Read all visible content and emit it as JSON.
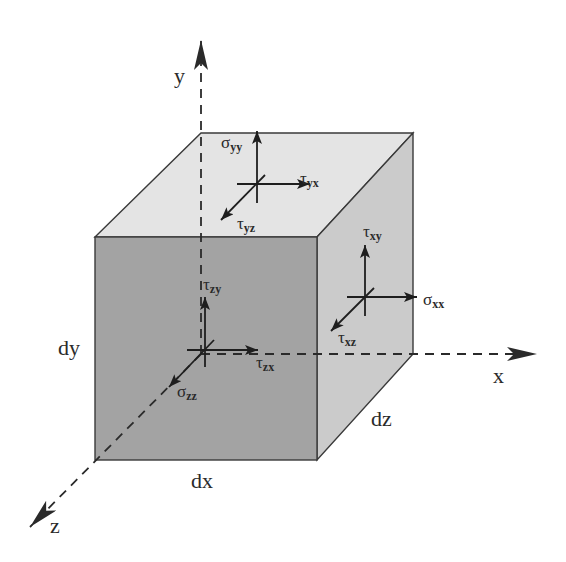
{
  "diagram": {
    "colors": {
      "front_face": "#a3a3a3",
      "top_face": "#e4e4e4",
      "right_face": "#cbcbcb",
      "edge": "#3a3a3a",
      "arrow": "#222222",
      "label": "#2a2a2a"
    },
    "axes": {
      "x": {
        "label": "x"
      },
      "y": {
        "label": "y"
      },
      "z": {
        "label": "z"
      }
    },
    "dimensions": {
      "dx": "dx",
      "dy": "dy",
      "dz": "dz"
    },
    "faces": {
      "top": {
        "name": "y-face",
        "stresses": [
          {
            "id": "sigma_yy",
            "symbol": "σ",
            "sub": "yy",
            "direction": "y"
          },
          {
            "id": "tau_yx",
            "symbol": "τ",
            "sub": "yx",
            "direction": "x"
          },
          {
            "id": "tau_yz",
            "symbol": "τ",
            "sub": "yz",
            "direction": "z"
          }
        ]
      },
      "right": {
        "name": "x-face",
        "stresses": [
          {
            "id": "tau_xy",
            "symbol": "τ",
            "sub": "xy",
            "direction": "y"
          },
          {
            "id": "sigma_xx",
            "symbol": "σ",
            "sub": "xx",
            "direction": "x"
          },
          {
            "id": "tau_xz",
            "symbol": "τ",
            "sub": "xz",
            "direction": "z"
          }
        ]
      },
      "front": {
        "name": "z-face",
        "stresses": [
          {
            "id": "tau_zy",
            "symbol": "τ",
            "sub": "zy",
            "direction": "y"
          },
          {
            "id": "tau_zx",
            "symbol": "τ",
            "sub": "zx",
            "direction": "x"
          },
          {
            "id": "sigma_zz",
            "symbol": "σ",
            "sub": "zz",
            "direction": "z"
          }
        ]
      }
    }
  }
}
